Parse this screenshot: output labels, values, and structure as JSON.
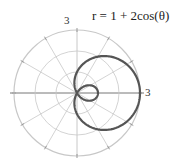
{
  "chart_data": {
    "type": "line",
    "subtype": "polar",
    "title": "r = 1 + 2cos(θ)",
    "equation": {
      "a": 1,
      "b": 2,
      "function": "cos"
    },
    "r_ticks": [
      1,
      2,
      3
    ],
    "r_max": 3,
    "r_tick_labels_shown": [
      "3",
      "3"
    ],
    "angular_gridlines_deg": [
      0,
      30,
      60,
      90,
      120,
      150,
      180,
      210,
      240,
      270,
      300,
      330
    ],
    "theta_range": [
      0,
      6.2832
    ],
    "features": {
      "inner_loop": true,
      "outer_loop_max_r": 3,
      "inner_loop_max_r": 1
    },
    "grid": true,
    "legend": null
  },
  "colors": {
    "curve": "#555555",
    "grid": "#c8c8c8",
    "axis": "#777777"
  },
  "labels": {
    "top_three": "3",
    "right_three": "3",
    "title": "r = 1 + 2cos(θ)"
  }
}
